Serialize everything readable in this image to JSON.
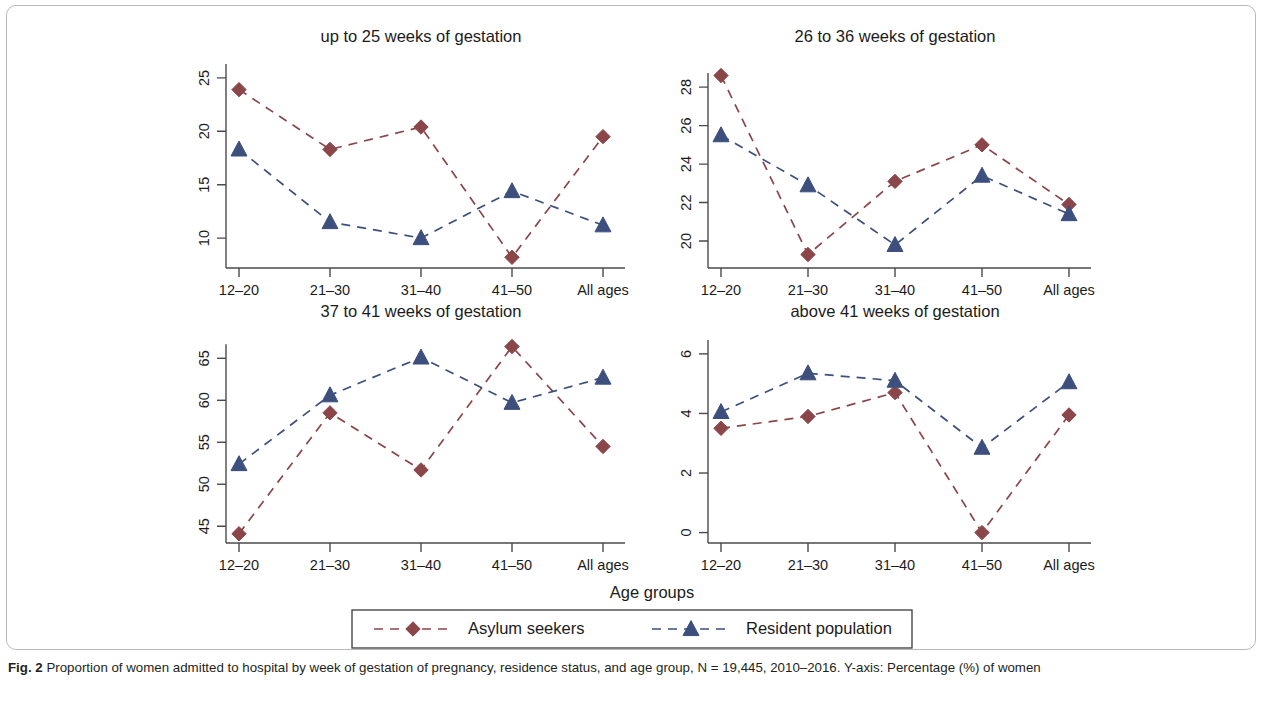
{
  "figure": {
    "axis_title_x": "Age groups",
    "caption_label": "Fig. 2",
    "caption_text": " Proportion of women admitted to hospital by week of gestation of pregnancy, residence status, and age group, N = 19,445, 2010–2016. Y-axis: Percentage (%) of women"
  },
  "legend": {
    "items": [
      {
        "label": "Asylum seekers",
        "color": "#8b4649",
        "marker": "diamond"
      },
      {
        "label": "Resident population",
        "color": "#3c4f7d",
        "marker": "triangle"
      }
    ]
  },
  "chart_data": [
    {
      "type": "line",
      "title": "up to 25 weeks of gestation",
      "xlabel": "Age groups",
      "ylabel": "Percentage (%) of women",
      "categories": [
        "12–20",
        "21–30",
        "31–40",
        "41–50",
        "All ages"
      ],
      "yticks": [
        10,
        15,
        20,
        25
      ],
      "ylim": [
        7.2,
        26.3
      ],
      "grid": false,
      "series": [
        {
          "name": "Asylum seekers",
          "color": "#8b4649",
          "marker": "diamond",
          "values": [
            23.9,
            18.3,
            20.4,
            8.2,
            19.5
          ]
        },
        {
          "name": "Resident population",
          "color": "#3c4f7d",
          "marker": "triangle",
          "values": [
            18.3,
            11.5,
            10.0,
            14.4,
            11.2
          ]
        }
      ]
    },
    {
      "type": "line",
      "title": "26 to 36 weeks of gestation",
      "xlabel": "Age groups",
      "ylabel": "Percentage (%) of women",
      "categories": [
        "12–20",
        "21–30",
        "31–40",
        "41–50",
        "All ages"
      ],
      "yticks": [
        20,
        22,
        24,
        26,
        28
      ],
      "ylim": [
        18.6,
        29.2
      ],
      "grid": false,
      "series": [
        {
          "name": "Asylum seekers",
          "color": "#8b4649",
          "marker": "diamond",
          "values": [
            28.6,
            19.3,
            23.1,
            25.0,
            21.9
          ]
        },
        {
          "name": "Resident population",
          "color": "#3c4f7d",
          "marker": "triangle",
          "values": [
            25.5,
            22.9,
            19.8,
            23.4,
            21.4
          ]
        }
      ]
    },
    {
      "type": "line",
      "title": "37 to 41 weeks of gestation",
      "xlabel": "Age groups",
      "ylabel": "Percentage (%) of women",
      "categories": [
        "12–20",
        "21–30",
        "31–40",
        "41–50",
        "All ages"
      ],
      "yticks": [
        45,
        50,
        55,
        60,
        65
      ],
      "ylim": [
        43.0,
        67.3
      ],
      "grid": false,
      "series": [
        {
          "name": "Asylum seekers",
          "color": "#8b4649",
          "marker": "diamond",
          "values": [
            44.1,
            58.5,
            51.7,
            66.4,
            54.5
          ]
        },
        {
          "name": "Resident population",
          "color": "#3c4f7d",
          "marker": "triangle",
          "values": [
            52.4,
            60.6,
            65.1,
            59.7,
            62.7
          ]
        }
      ]
    },
    {
      "type": "line",
      "title": "above 41 weeks of gestation",
      "xlabel": "Age groups",
      "ylabel": "Percentage (%) of women",
      "categories": [
        "12–20",
        "21–30",
        "31–40",
        "41–50",
        "All ages"
      ],
      "yticks": [
        0,
        2,
        4,
        6
      ],
      "ylim": [
        -0.35,
        6.5
      ],
      "grid": false,
      "series": [
        {
          "name": "Asylum seekers",
          "color": "#8b4649",
          "marker": "diamond",
          "values": [
            3.5,
            3.9,
            4.7,
            0.0,
            3.95
          ]
        },
        {
          "name": "Resident population",
          "color": "#3c4f7d",
          "marker": "triangle",
          "values": [
            4.05,
            5.35,
            5.1,
            2.85,
            5.05
          ]
        }
      ]
    }
  ]
}
